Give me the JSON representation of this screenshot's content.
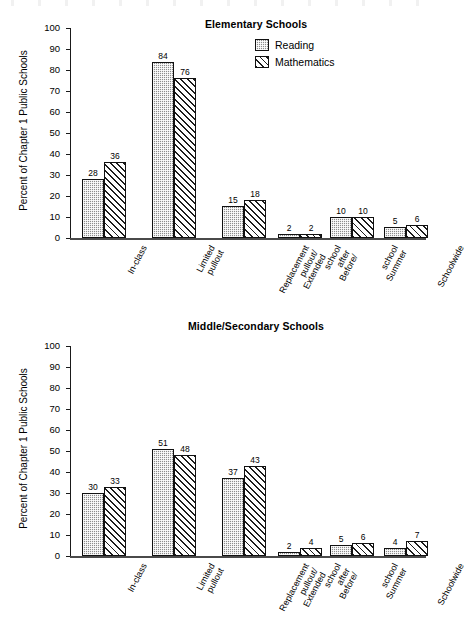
{
  "figure": {
    "ylabel": "Percent of Chapter 1 Public Schools",
    "y_ticks": [
      "100",
      "90",
      "80",
      "70",
      "60",
      "50",
      "40",
      "30",
      "20",
      "10",
      "0"
    ],
    "legend": {
      "position": "top-right",
      "entries": [
        {
          "label": "Reading",
          "pattern": "checkered-gray",
          "color": "#8d8d8d"
        },
        {
          "label": "Mathematics",
          "pattern": "diagonal-hatch",
          "color": "#ffffff"
        }
      ]
    },
    "categories": [
      [
        "In-class"
      ],
      [
        "Limited",
        "pullout"
      ],
      [
        "Replacement",
        "pullout/",
        "Extended"
      ],
      [
        "school",
        "after",
        "Before/"
      ],
      [
        "school",
        "Summer"
      ],
      [
        "Schoolwide"
      ]
    ]
  },
  "chart_data": [
    {
      "type": "bar",
      "title": "Elementary Schools",
      "xlabel": "",
      "ylabel": "Percent of Chapter 1 Public Schools",
      "ylim": [
        0,
        100
      ],
      "ytick_step": 10,
      "grid": false,
      "legend_position": "top-right",
      "categories": [
        "In-class",
        "Limited pullout",
        "Replacement pullout/ Extended",
        "Before/ after school",
        "Summer school",
        "Schoolwide"
      ],
      "series": [
        {
          "name": "Reading",
          "values": [
            28,
            84,
            15,
            2,
            10,
            5
          ]
        },
        {
          "name": "Mathematics",
          "values": [
            36,
            76,
            18,
            2,
            10,
            6
          ]
        }
      ]
    },
    {
      "type": "bar",
      "title": "Middle/Secondary Schools",
      "xlabel": "",
      "ylabel": "Percent of Chapter 1 Public Schools",
      "ylim": [
        0,
        100
      ],
      "ytick_step": 10,
      "grid": false,
      "legend_position": "none",
      "categories": [
        "In-class",
        "Limited pullout",
        "Replacement pullout/ Extended",
        "Before/ after school",
        "Summer school",
        "Schoolwide"
      ],
      "series": [
        {
          "name": "Reading",
          "values": [
            30,
            51,
            37,
            2,
            5,
            4
          ]
        },
        {
          "name": "Mathematics",
          "values": [
            33,
            48,
            43,
            4,
            6,
            7
          ]
        }
      ]
    }
  ]
}
